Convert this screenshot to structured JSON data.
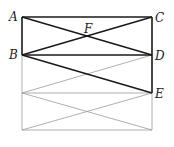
{
  "diagram": {
    "type": "geometry",
    "points": {
      "A": {
        "label": "A",
        "x": 22,
        "y": 17
      },
      "B": {
        "label": "B",
        "x": 22,
        "y": 55
      },
      "C": {
        "label": "C",
        "x": 152,
        "y": 17
      },
      "D": {
        "label": "D",
        "x": 152,
        "y": 55
      },
      "E": {
        "label": "E",
        "x": 152,
        "y": 93
      },
      "F": {
        "label": "F",
        "x": 87,
        "y": 36
      }
    },
    "thick_segments": [
      [
        "A",
        "C"
      ],
      [
        "A",
        "B"
      ],
      [
        "C",
        "D"
      ],
      [
        "B",
        "D"
      ],
      [
        "A",
        "D"
      ],
      [
        "B",
        "C"
      ],
      [
        "B",
        "E"
      ],
      [
        "D",
        "E"
      ]
    ],
    "thin_segments": [
      {
        "x1": 22,
        "y1": 55,
        "x2": 22,
        "y2": 130
      },
      {
        "x1": 22,
        "y1": 93,
        "x2": 152,
        "y2": 93
      },
      {
        "x1": 22,
        "y1": 130,
        "x2": 152,
        "y2": 130
      },
      {
        "x1": 152,
        "y1": 93,
        "x2": 152,
        "y2": 130
      },
      {
        "x1": 22,
        "y1": 93,
        "x2": 152,
        "y2": 55
      },
      {
        "x1": 22,
        "y1": 93,
        "x2": 152,
        "y2": 130
      },
      {
        "x1": 22,
        "y1": 130,
        "x2": 152,
        "y2": 93
      }
    ],
    "colors": {
      "thick": "#1a1a1a",
      "thin": "#9a9a9a",
      "background": "#ffffff"
    }
  }
}
